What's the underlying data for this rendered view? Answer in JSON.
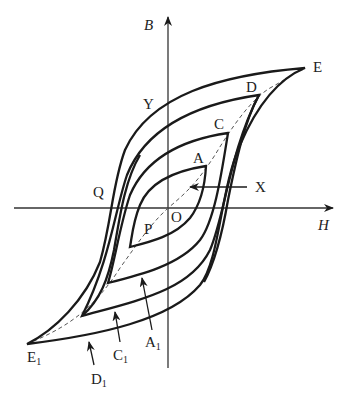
{
  "axes": {
    "x_label": "H",
    "y_label": "B",
    "origin_label": "O"
  },
  "points": {
    "E": "E",
    "D": "D",
    "C": "C",
    "A": "A",
    "Y": "Y",
    "Q": "Q",
    "X": "X",
    "P": "P",
    "E1": {
      "base": "E",
      "sub": "1"
    },
    "D1": {
      "base": "D",
      "sub": "1"
    },
    "C1": {
      "base": "C",
      "sub": "1"
    },
    "A1": {
      "base": "A",
      "sub": "1"
    }
  },
  "colors": {
    "stroke": "#1a1a1a",
    "dashed": "#555555"
  }
}
